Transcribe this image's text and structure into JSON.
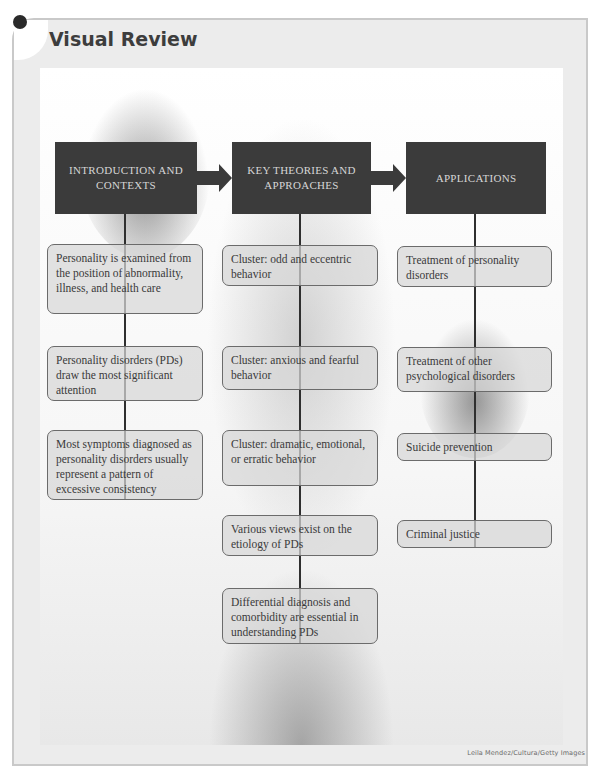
{
  "page": {
    "title": "Visual Review",
    "photo_credit": "Leila Mendez/Cultura/Getty Images"
  },
  "columns": [
    {
      "header": "Introduction and Contexts",
      "items": [
        "Personality is examined from the position of abnormality, illness, and health care",
        "Personality disorders (PDs) draw the most significant attention",
        "Most symptoms diagnosed as personality disorders usually represent a pattern of excessive consistency"
      ]
    },
    {
      "header": "Key Theories and Approaches",
      "items": [
        "Cluster: odd and eccentric behavior",
        "Cluster: anxious and fearful behavior",
        "Cluster: dramatic, emotional, or erratic behavior",
        "Various views exist on the etiology of PDs",
        "Differential diagnosis and comorbidity are essential in understanding PDs"
      ]
    },
    {
      "header": "Applications",
      "items": [
        "Treatment of personality disorders",
        "Treatment of other psychological disorders",
        "Suicide prevention",
        "Criminal justice"
      ]
    }
  ],
  "colors": {
    "header_bg": "#3b3b3b",
    "header_text": "#d6d6d6",
    "node_bg": "#d7d7d7",
    "node_border": "#6b6b6b",
    "connector": "#2f2f2f",
    "frame_bg": "#ececec",
    "title_text": "#3d3d3d"
  }
}
